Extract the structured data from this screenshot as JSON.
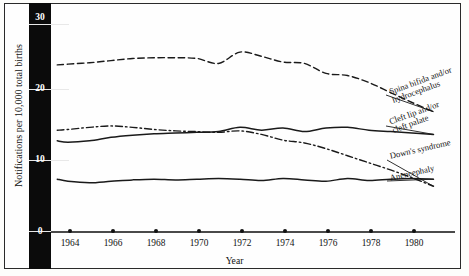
{
  "figure": {
    "y_axis_title": "Notifications per 10,000 total births",
    "x_axis_title": "Year",
    "y_ticks": [
      "0",
      "10",
      "20",
      "30"
    ],
    "x_ticks": [
      "1964",
      "1966",
      "1968",
      "1970",
      "1972",
      "1974",
      "1976",
      "1978",
      "1980"
    ]
  },
  "series_labels": {
    "spina_bifida": {
      "line1": "Spina bifida and/or",
      "line2": "hydrocephalus"
    },
    "cleft_lip": {
      "line1": "Cleft lip and/or",
      "line2": "cleft palate"
    },
    "downs": {
      "line1": "Down's syndrome"
    },
    "anencephaly": {
      "line1": "Anencephaly"
    }
  },
  "chart_data": {
    "type": "line",
    "title": "",
    "xlabel": "Year",
    "ylabel": "Notifications per 10,000 total births",
    "xlim": [
      1963,
      1981.5
    ],
    "ylim": [
      0,
      30
    ],
    "yticks": [
      0,
      10,
      20,
      30
    ],
    "xticks": [
      1964,
      1966,
      1968,
      1970,
      1972,
      1974,
      1976,
      1978,
      1980
    ],
    "grid": false,
    "legend": "inline-right-labels",
    "x": [
      1963.5,
      1964,
      1965,
      1966,
      1967,
      1968,
      1969,
      1970,
      1971,
      1972,
      1973,
      1974,
      1975,
      1976,
      1977,
      1978,
      1979,
      1980,
      1981
    ],
    "series": [
      {
        "name": "Spina bifida and/or hydrocephalus",
        "style": "dashed",
        "color": "#1a1a1a",
        "values": [
          23.4,
          23.5,
          23.7,
          24.0,
          24.3,
          24.4,
          24.4,
          24.3,
          23.6,
          25.2,
          24.6,
          23.8,
          23.6,
          22.2,
          21.9,
          20.9,
          19.5,
          18.1,
          16.8
        ]
      },
      {
        "name": "Down's syndrome",
        "style": "dash-dot",
        "color": "#1a1a1a",
        "values": [
          14.2,
          14.3,
          14.6,
          14.8,
          14.6,
          14.3,
          14.1,
          14.0,
          13.9,
          14.1,
          13.6,
          12.8,
          12.4,
          11.6,
          10.6,
          9.6,
          8.6,
          7.5,
          6.3
        ]
      },
      {
        "name": "Cleft lip and/or cleft palate",
        "style": "solid",
        "color": "#1a1a1a",
        "values": [
          12.7,
          12.5,
          12.7,
          13.2,
          13.5,
          13.7,
          13.8,
          13.9,
          14.0,
          14.6,
          14.2,
          14.5,
          14.0,
          14.5,
          14.6,
          14.2,
          14.0,
          13.8,
          13.6
        ]
      },
      {
        "name": "Anencephaly",
        "style": "solid",
        "color": "#1a1a1a",
        "values": [
          7.3,
          7.0,
          6.8,
          7.0,
          7.2,
          7.3,
          7.2,
          7.3,
          7.4,
          7.3,
          7.1,
          7.4,
          7.2,
          7.0,
          7.4,
          7.1,
          7.3,
          7.4,
          7.3
        ]
      }
    ]
  }
}
